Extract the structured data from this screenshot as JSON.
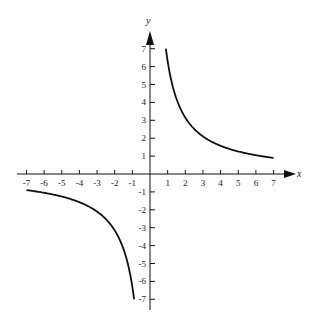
{
  "chart_data": {
    "type": "line",
    "title": "",
    "xlabel": "x",
    "ylabel": "y",
    "xlim": [
      -7,
      7
    ],
    "ylim": [
      -7,
      7
    ],
    "grid": false,
    "legend": null,
    "x_ticks": [
      -7,
      -6,
      -5,
      -4,
      -3,
      -2,
      -1,
      1,
      2,
      3,
      4,
      5,
      6,
      7
    ],
    "y_ticks": [
      -7,
      -6,
      -5,
      -4,
      -3,
      -2,
      -1,
      1,
      2,
      3,
      4,
      5,
      6,
      7
    ],
    "x_tick_labels": [
      "-7",
      "-6",
      "-5",
      "-4",
      "-3",
      "-2",
      "-1",
      "1",
      "2",
      "3",
      "4",
      "5",
      "6",
      "7"
    ],
    "y_tick_labels": [
      "-7",
      "-6",
      "-5",
      "-4",
      "-3",
      "-2",
      "-1",
      "1",
      "2",
      "3",
      "4",
      "5",
      "6",
      "7"
    ],
    "function": "y = k/x (rectangular hyperbola)",
    "k": 6.3,
    "series": [
      {
        "name": "branch-quadrant-I",
        "x": [
          0.9,
          1,
          1.5,
          2,
          3,
          4,
          5,
          6,
          7
        ],
        "y": [
          7.0,
          6.3,
          4.2,
          3.15,
          2.1,
          1.58,
          1.26,
          1.05,
          0.9
        ]
      },
      {
        "name": "branch-quadrant-III",
        "x": [
          -7,
          -6,
          -5,
          -4,
          -3,
          -2,
          -1.5,
          -1,
          -0.9
        ],
        "y": [
          -0.9,
          -1.05,
          -1.26,
          -1.58,
          -2.1,
          -3.15,
          -4.2,
          -6.3,
          -7.0
        ]
      }
    ],
    "colors": {
      "curve": "#111111",
      "axis": "#111111"
    }
  },
  "axes": {
    "x_label": "x",
    "y_label": "y"
  }
}
